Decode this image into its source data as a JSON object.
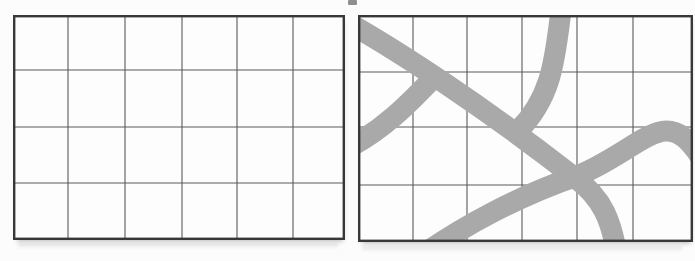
{
  "figure": {
    "page_background": "#fcfcfc",
    "colors": {
      "band": "#a9a9a9",
      "grid_line": "#5a5a5a",
      "border": "#383838",
      "shadow_smear": "#c8c8c8"
    },
    "band_stroke_width": 21,
    "grid_line_width": 1.1,
    "border_width": 2.4,
    "panels": [
      {
        "name": "left-grid",
        "x": 13,
        "y": 15,
        "width": 332,
        "height": 225,
        "cols": 6,
        "rows": 4,
        "col_lines_x": [
          55,
          112,
          169,
          224,
          280
        ],
        "row_lines_y": [
          55,
          112,
          168
        ],
        "curves": []
      },
      {
        "name": "right-grid",
        "x": 358,
        "y": 15,
        "width": 335,
        "height": 227,
        "cols": 6,
        "rows": 4,
        "col_lines_x": [
          55,
          109,
          164,
          219,
          275
        ],
        "row_lines_y": [
          57,
          112,
          170
        ],
        "curves": [
          {
            "name": "main-diagonal-band",
            "d": "M -20 2 C 40 35 130 95 216 162 C 245 183 254 206 260 246"
          },
          {
            "name": "left-branch-band",
            "d": "M -8 132 C 25 114 48 92 80 58"
          },
          {
            "name": "top-branch-band",
            "d": "M 204 -12 C 197 40 196 80 160 116"
          },
          {
            "name": "bottom-sweep-band",
            "d": "M 45 254 C 105 208 170 178 216 162 C 255 148 288 116 308 116 C 322 116 331 125 342 141"
          }
        ]
      }
    ],
    "artifact": {
      "x": 348,
      "y": 0,
      "width": 9,
      "height": 5,
      "color": "#8f8f8f"
    },
    "smears": [
      {
        "x": 18,
        "y": 243,
        "width": 320,
        "height": 6
      },
      {
        "x": 362,
        "y": 246,
        "width": 320,
        "height": 6
      }
    ]
  }
}
